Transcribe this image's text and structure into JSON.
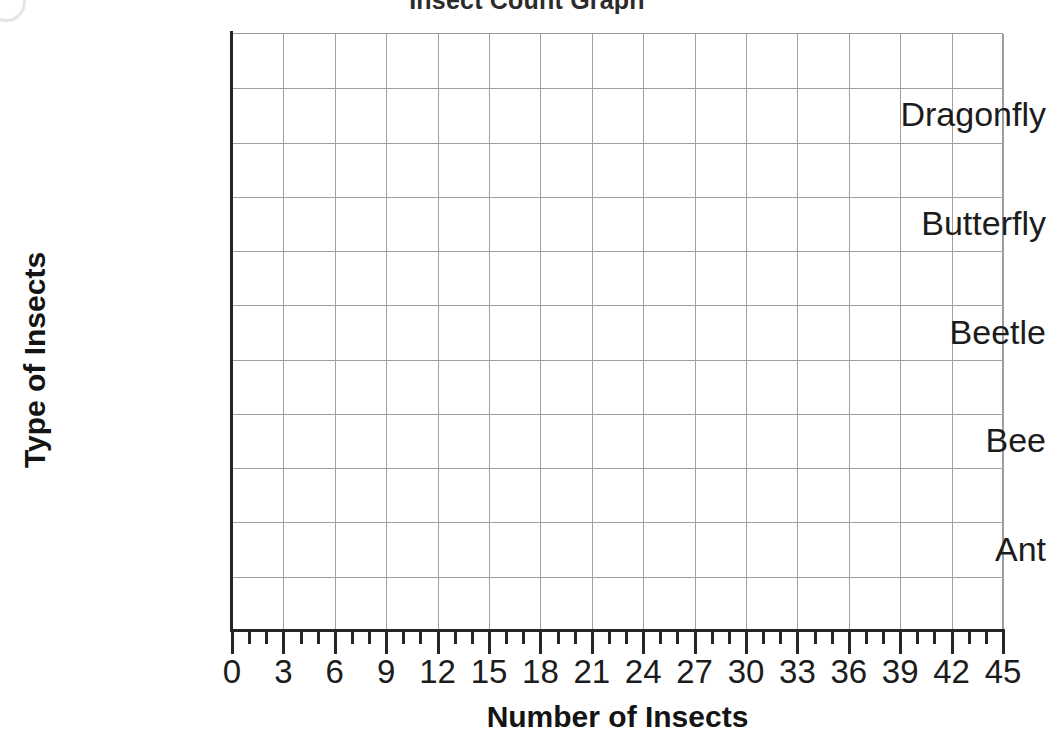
{
  "chart_data": {
    "type": "bar",
    "orientation": "horizontal",
    "title": "Insect Count Graph",
    "xlabel": "Number of Insects",
    "ylabel": "Type of Insects",
    "categories": [
      "Ant",
      "Bee",
      "Beetle",
      "Butterfly",
      "Dragonfly"
    ],
    "values": [
      null,
      null,
      null,
      null,
      null
    ],
    "xlim": [
      0,
      45
    ],
    "xticks": [
      0,
      3,
      6,
      9,
      12,
      15,
      18,
      21,
      24,
      27,
      30,
      33,
      36,
      39,
      42,
      45
    ],
    "xtick_labels": [
      "0",
      "3",
      "6",
      "9",
      "12",
      "15",
      "18",
      "21",
      "24",
      "27",
      "30",
      "33",
      "36",
      "39",
      "42",
      "45"
    ],
    "x_minor_tick_step": 1,
    "x_major_tick_step": 3,
    "grid": true,
    "grid_color": "#a0a0a0",
    "axis_color": "#262626",
    "background_color": "#ffffff",
    "legend": null,
    "note": "Empty grid template - no bars plotted"
  }
}
